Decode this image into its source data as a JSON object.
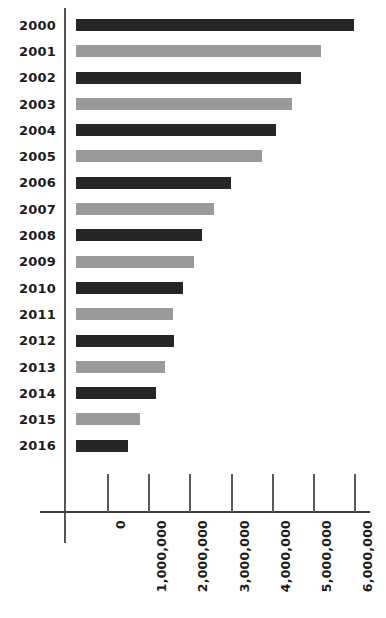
{
  "chart_data": {
    "type": "bar",
    "orientation": "horizontal",
    "title": "",
    "subtitle": "",
    "xlabel": "",
    "ylabel": "",
    "grid": false,
    "legend": null,
    "xlim": [
      0,
      6200000
    ],
    "x_ticks": [
      0,
      1000000,
      2000000,
      3000000,
      4000000,
      5000000,
      6000000
    ],
    "x_tick_labels": [
      "0",
      "1,000,000",
      "2,000,000",
      "3,000,000",
      "4,000,000",
      "5,000,000",
      "6,000,000"
    ],
    "x_tick_label_rotation": -90,
    "categories": [
      "2000",
      "2001",
      "2002",
      "2003",
      "2004",
      "2005",
      "2006",
      "2007",
      "2008",
      "2009",
      "2010",
      "2011",
      "2012",
      "2013",
      "2014",
      "2015",
      "2016"
    ],
    "values": [
      6000000,
      5200000,
      4700000,
      4500000,
      4100000,
      3750000,
      3000000,
      2600000,
      2300000,
      2100000,
      1850000,
      1600000,
      1620000,
      1400000,
      1200000,
      800000,
      500000
    ],
    "bars": [
      {
        "category": "2000",
        "value": 6000000,
        "value_label": "6,000,000",
        "color": "#262626",
        "color_name": "dark"
      },
      {
        "category": "2001",
        "value": 5200000,
        "value_label": "5,200,000",
        "color": "#9a9a9a",
        "color_name": "light"
      },
      {
        "category": "2002",
        "value": 4700000,
        "value_label": "4,700,000",
        "color": "#262626",
        "color_name": "dark"
      },
      {
        "category": "2003",
        "value": 4500000,
        "value_label": "4,500,000",
        "color": "#9a9a9a",
        "color_name": "light"
      },
      {
        "category": "2004",
        "value": 4100000,
        "value_label": "4,100,000",
        "color": "#262626",
        "color_name": "dark"
      },
      {
        "category": "2005",
        "value": 3750000,
        "value_label": "3,750,000",
        "color": "#9a9a9a",
        "color_name": "light"
      },
      {
        "category": "2006",
        "value": 3000000,
        "value_label": "3,000,000",
        "color": "#262626",
        "color_name": "dark"
      },
      {
        "category": "2007",
        "value": 2600000,
        "value_label": "2,600,000",
        "color": "#9a9a9a",
        "color_name": "light"
      },
      {
        "category": "2008",
        "value": 2300000,
        "value_label": "2,300,000",
        "color": "#262626",
        "color_name": "dark"
      },
      {
        "category": "2009",
        "value": 2100000,
        "value_label": "2,100,000",
        "color": "#9a9a9a",
        "color_name": "light"
      },
      {
        "category": "2010",
        "value": 1850000,
        "value_label": "1,850,000",
        "color": "#262626",
        "color_name": "dark"
      },
      {
        "category": "2011",
        "value": 1600000,
        "value_label": "1,600,000",
        "color": "#9a9a9a",
        "color_name": "light"
      },
      {
        "category": "2012",
        "value": 1620000,
        "value_label": "1,620,000",
        "color": "#262626",
        "color_name": "dark"
      },
      {
        "category": "2013",
        "value": 1400000,
        "value_label": "1,400,000",
        "color": "#9a9a9a",
        "color_name": "light"
      },
      {
        "category": "2014",
        "value": 1200000,
        "value_label": "1,200,000",
        "color": "#262626",
        "color_name": "dark"
      },
      {
        "category": "2015",
        "value": 800000,
        "value_label": "800,000",
        "color": "#9a9a9a",
        "color_name": "light"
      },
      {
        "category": "2016",
        "value": 500000,
        "value_label": "500,000",
        "color": "#262626",
        "color_name": "dark"
      }
    ]
  },
  "colors": {
    "dark_bar": "#262626",
    "light_bar": "#9a9a9a",
    "axis": "#3d3d3d",
    "text": "#1c1c1c",
    "background": "#ffffff"
  }
}
